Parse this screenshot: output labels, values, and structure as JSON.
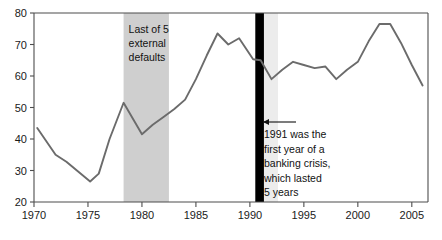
{
  "chart_data": {
    "type": "line",
    "title": "",
    "xlabel": "",
    "ylabel": "",
    "xlim": [
      1970,
      2006.5
    ],
    "ylim": [
      20,
      80
    ],
    "grid": false,
    "legend": "none",
    "y_ticks": [
      "20",
      "30",
      "40",
      "50",
      "60",
      "70",
      "80"
    ],
    "y_tick_values": [
      20,
      30,
      40,
      50,
      60,
      70,
      80
    ],
    "x_ticks": [
      "1970",
      "1975",
      "1980",
      "1985",
      "1990",
      "1995",
      "2000",
      "2005"
    ],
    "x_tick_values": [
      1970,
      1975,
      1980,
      1985,
      1990,
      1995,
      2000,
      2005
    ],
    "series": [
      {
        "name": "series-1",
        "color": "#6b6b6b",
        "x": [
          1970.3,
          1972,
          1973,
          1975.2,
          1976,
          1977,
          1978.3,
          1980,
          1981,
          1982,
          1983,
          1984,
          1985,
          1986,
          1987,
          1988,
          1989,
          1990.3,
          1991,
          1992,
          1993,
          1994,
          1995,
          1996,
          1997,
          1998,
          1999,
          2000,
          2001,
          2002,
          2003,
          2004,
          2005,
          2006
        ],
        "values": [
          43.5,
          35.0,
          32.8,
          26.5,
          29.0,
          40.0,
          51.5,
          41.5,
          44.5,
          47.0,
          49.5,
          52.5,
          59.0,
          66.5,
          73.5,
          70.0,
          72.0,
          65.3,
          65.0,
          59.0,
          62.0,
          64.5,
          63.5,
          62.5,
          63.0,
          59.0,
          62.0,
          64.5,
          71.0,
          76.5,
          76.5,
          70.5,
          63.5,
          57.0
        ]
      }
    ],
    "shaded_bands": [
      {
        "name": "external-defaults-band",
        "from": 1978.3,
        "to": 1982.5,
        "color": "#cfcfcf",
        "label": "Last of 5\nexternal\ndefaults",
        "label_lines": [
          "Last of 5",
          "external",
          "defaults"
        ]
      },
      {
        "name": "banking-crisis-band",
        "from": 1991.2,
        "to": 1992.6,
        "color": "#ececec",
        "label": "",
        "label_lines": []
      }
    ],
    "vertical_markers": [
      {
        "name": "banking-crisis-marker",
        "at": 1990.9,
        "color": "#000000",
        "width_years": 0.8
      }
    ],
    "annotations": [
      {
        "name": "banking-crisis-annotation",
        "lines": [
          "1991 was the",
          "first year of a",
          "banking crisis,",
          "which lasted",
          "5 years"
        ],
        "arrow": "left-arrow"
      }
    ],
    "axis_color": "#4d4d4d",
    "plot_bg": "#ffffff"
  }
}
